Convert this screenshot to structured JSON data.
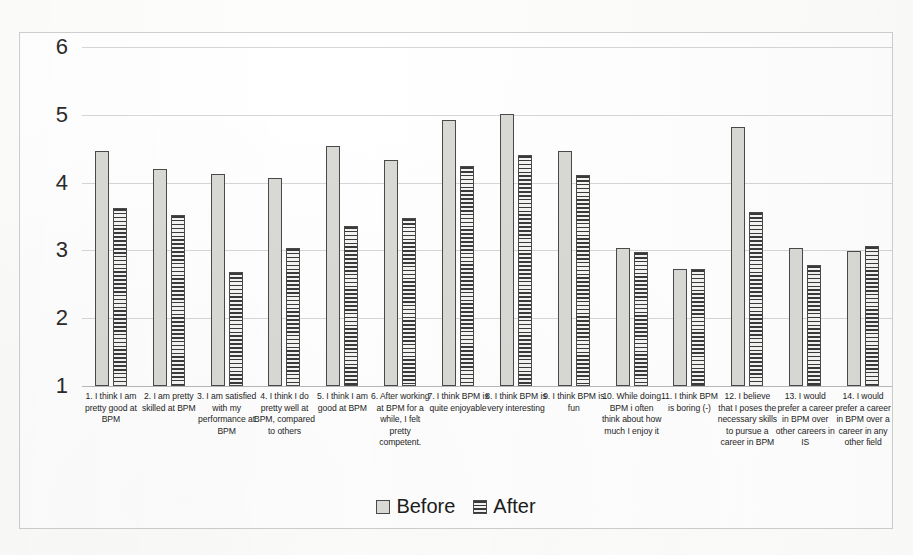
{
  "chart_data": {
    "type": "bar",
    "title": "",
    "subtitle": "",
    "xlabel": "",
    "ylabel": "",
    "ylim": [
      1,
      6
    ],
    "yticks": [
      1,
      2,
      3,
      4,
      5,
      6
    ],
    "ytick_labels": [
      "1",
      "2",
      "3",
      "4",
      "5",
      "6"
    ],
    "grid": true,
    "legend_position": "bottom",
    "categories": [
      "1.   I think I am pretty good at BPM",
      "2.   I am pretty skilled at BPM",
      "3.   I am satisfied with my performance at BPM",
      "4.   I think I do pretty well at BPM, compared to others",
      "5.   I think I am good at BPM",
      "6.   After working at BPM for a while, I felt pretty competent.",
      "7.   I think BPM is quite enjoyable",
      "8.   I think BPM is very interesting",
      "9.   I think BPM is fun",
      "10. While doing BPM i often think about how much I enjoy it",
      "11. I think BPM is boring (-)",
      "12. I believe that I poses the necessary skills to pursue a career in BPM",
      "13. I would prefer a career in BPM over other careers in IS",
      "14. I would prefer a career in BPM over a career in any other field"
    ],
    "series": [
      {
        "name": "Before",
        "fill": "dotted-light-gray",
        "color": "#d9d9d6",
        "values": [
          4.46,
          4.2,
          4.12,
          4.07,
          4.54,
          4.34,
          4.92,
          5.01,
          4.47,
          3.03,
          2.72,
          4.82,
          3.03,
          2.99
        ]
      },
      {
        "name": "After",
        "fill": "horizontal-lines",
        "color": "#3a3a3a",
        "values": [
          3.62,
          3.52,
          2.68,
          3.03,
          3.36,
          3.48,
          4.24,
          4.41,
          4.11,
          2.97,
          2.72,
          3.56,
          2.79,
          3.06
        ]
      }
    ]
  },
  "legend": {
    "items": [
      {
        "label": "Before",
        "pattern": "dotted"
      },
      {
        "label": "After",
        "pattern": "striped"
      }
    ]
  },
  "axes": {
    "y_axis_min_label": "1",
    "y_axis_max_label": "6"
  }
}
